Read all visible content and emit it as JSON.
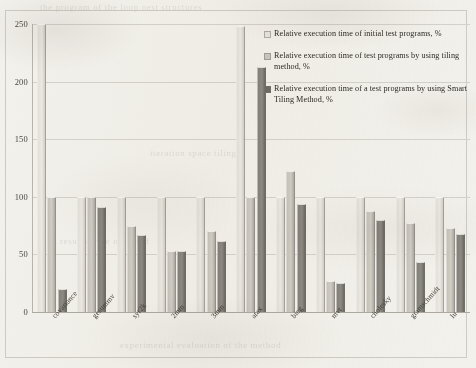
{
  "chart_data": {
    "type": "bar",
    "title": "",
    "xlabel": "",
    "ylabel": "",
    "ylim": [
      0,
      250
    ],
    "yticks": [
      0,
      50,
      100,
      150,
      200,
      250
    ],
    "grid": true,
    "legend_position": "top-right-inside",
    "categories": [
      "covariance",
      "gesummv",
      "syr2k",
      "2mm",
      "3mm",
      "atax",
      "bicg",
      "mvt",
      "cholesky",
      "gramschmidt",
      "lu"
    ],
    "series": [
      {
        "name": "Relative execution time of initial test programs, %",
        "color": "#e8e6e0",
        "values": [
          250,
          100,
          100,
          100,
          100,
          248,
          100,
          100,
          100,
          100,
          100
        ]
      },
      {
        "name": "Relative execution time of test programs by using tiling method, %",
        "color": "#cbc8c0",
        "values": [
          100,
          100,
          75,
          53,
          70,
          100,
          122,
          27,
          88,
          77,
          73
        ]
      },
      {
        "name": "Relative execution time of a test programs by using Smart Tiling Method, %",
        "color": "#6f6c66",
        "values": [
          20,
          91,
          67,
          53,
          62,
          213,
          94,
          25,
          80,
          43,
          68
        ]
      }
    ]
  },
  "legend": {
    "items": [
      {
        "swatch": "s1",
        "label": "Relative execution time of initial test programs, %"
      },
      {
        "swatch": "s2",
        "label": "Relative execution time of test programs by using tiling method, %"
      },
      {
        "swatch": "s3",
        "label": "Relative execution time of a test programs by using Smart Tiling Method, %"
      }
    ]
  },
  "scan_artifacts": {
    "ghost_lines": [
      {
        "text": "the program  of  the loop nest  structures",
        "x": 40,
        "y": 2
      },
      {
        "text": "iteration space tiling",
        "x": 150,
        "y": 148
      },
      {
        "text": "results were obtained",
        "x": 60,
        "y": 236
      },
      {
        "text": "experimental evaluation of the method",
        "x": 120,
        "y": 340
      }
    ]
  }
}
